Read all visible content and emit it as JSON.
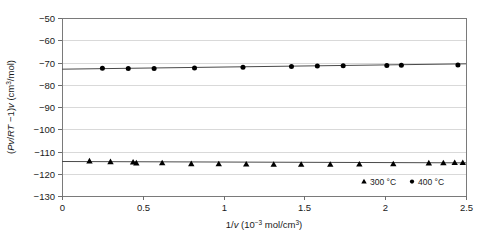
{
  "chart_data": {
    "type": "scatter",
    "title": "",
    "xlabel": "1/v (10^-3 mol/cm^3)",
    "ylabel": "(Pv/RT -1)v (cm^3/mol)",
    "xlabel_parts": {
      "prefix": "1/",
      "var": "v",
      "open": " (10",
      "exp": "−3",
      "mid": " mol/cm",
      "exp2": "3",
      "close": ")"
    },
    "ylabel_parts": {
      "open": "(",
      "var1": "Pv",
      "slash": "/",
      "var2": "RT",
      "minus": " −1)",
      "var3": "v",
      "unit_open": " (cm",
      "exp": "3",
      "unit_close": "/mol)"
    },
    "xlim": [
      0,
      2.5
    ],
    "ylim": [
      -130,
      -50
    ],
    "xticks": [
      0,
      0.5,
      1,
      1.5,
      2,
      2.5
    ],
    "xtick_labels": [
      "0",
      "0.5",
      "1",
      "1.5",
      "2",
      "2.5"
    ],
    "yticks": [
      -130,
      -120,
      -110,
      -100,
      -90,
      -80,
      -70,
      -60,
      -50
    ],
    "ytick_labels": [
      "−130",
      "−120",
      "−110",
      "−100",
      "−90",
      "−80",
      "−70",
      "−60",
      "−50"
    ],
    "grid": true,
    "grid_axis": "y",
    "legend_position": "bottom-right",
    "series": [
      {
        "name": "300 °C",
        "marker": "triangle",
        "color": "#000000",
        "points": [
          {
            "x": 0.17,
            "y": -114.3
          },
          {
            "x": 0.3,
            "y": -114.6
          },
          {
            "x": 0.44,
            "y": -114.8
          },
          {
            "x": 0.46,
            "y": -115.2
          },
          {
            "x": 0.62,
            "y": -115.1
          },
          {
            "x": 0.8,
            "y": -115.5
          },
          {
            "x": 0.97,
            "y": -115.6
          },
          {
            "x": 1.14,
            "y": -115.7
          },
          {
            "x": 1.31,
            "y": -115.8
          },
          {
            "x": 1.48,
            "y": -115.8
          },
          {
            "x": 1.66,
            "y": -115.8
          },
          {
            "x": 1.84,
            "y": -115.7
          },
          {
            "x": 2.05,
            "y": -115.6
          },
          {
            "x": 2.27,
            "y": -115.2
          },
          {
            "x": 2.36,
            "y": -115.1
          },
          {
            "x": 2.43,
            "y": -115.0
          },
          {
            "x": 2.48,
            "y": -115.0
          }
        ],
        "trend": {
          "x0": 0.0,
          "y0": -114.5,
          "x1": 2.5,
          "y1": -115.1
        }
      },
      {
        "name": "400 °C",
        "marker": "circle",
        "color": "#000000",
        "points": [
          {
            "x": 0.25,
            "y": -72.6
          },
          {
            "x": 0.41,
            "y": -72.7
          },
          {
            "x": 0.57,
            "y": -72.7
          },
          {
            "x": 0.82,
            "y": -72.5
          },
          {
            "x": 1.12,
            "y": -72.1
          },
          {
            "x": 1.42,
            "y": -71.8
          },
          {
            "x": 1.58,
            "y": -71.6
          },
          {
            "x": 1.74,
            "y": -71.5
          },
          {
            "x": 2.01,
            "y": -71.3
          },
          {
            "x": 2.1,
            "y": -71.2
          },
          {
            "x": 2.45,
            "y": -71.1
          }
        ],
        "trend": {
          "x0": 0.0,
          "y0": -73.0,
          "x1": 2.5,
          "y1": -70.6
        }
      }
    ]
  },
  "legend": {
    "items": [
      {
        "label": "300 °C",
        "marker": "triangle"
      },
      {
        "label": "400 °C",
        "marker": "circle"
      }
    ]
  }
}
